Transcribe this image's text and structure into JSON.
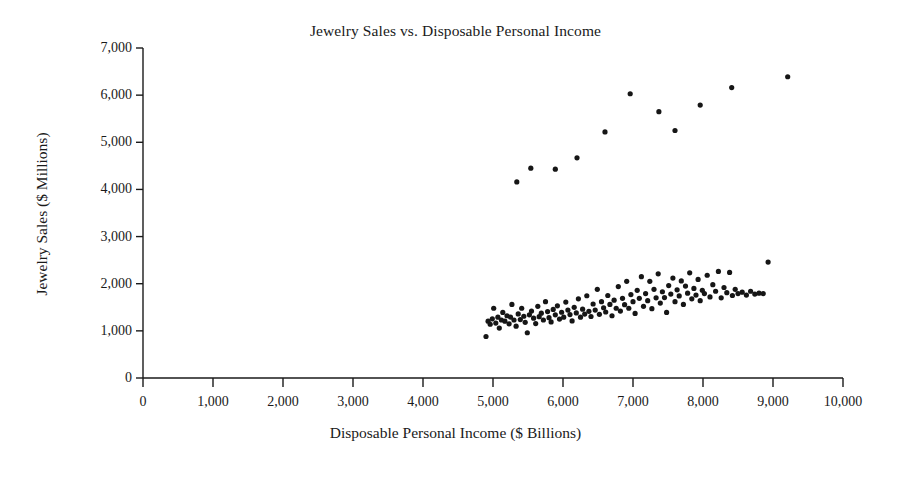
{
  "chart_data": {
    "type": "scatter",
    "title": "Jewelry Sales vs. Disposable Personal Income",
    "xlabel": "Disposable Personal Income ($ Billions)",
    "ylabel": "Jewelry Sales ($ Millions)",
    "xlim": [
      0,
      10000
    ],
    "ylim": [
      0,
      7000
    ],
    "xticks": [
      0,
      1000,
      2000,
      3000,
      4000,
      5000,
      6000,
      7000,
      8000,
      9000,
      10000
    ],
    "yticks": [
      0,
      1000,
      2000,
      3000,
      4000,
      5000,
      6000,
      7000
    ],
    "xtick_labels": [
      "0",
      "1,000",
      "2,000",
      "3,000",
      "4,000",
      "5,000",
      "6,000",
      "7,000",
      "8,000",
      "9,000",
      "10,000"
    ],
    "ytick_labels": [
      "0",
      "1,000",
      "2,000",
      "3,000",
      "4,000",
      "5,000",
      "6,000",
      "7,000"
    ],
    "grid": false,
    "legend": false,
    "marker": {
      "shape": "circle",
      "color": "#161616",
      "size": 5.2
    },
    "series": [
      {
        "name": "Monthly jewelry sales",
        "points": [
          [
            4900,
            880
          ],
          [
            4930,
            1205
          ],
          [
            4960,
            1140
          ],
          [
            4990,
            1255
          ],
          [
            5010,
            1480
          ],
          [
            5040,
            1165
          ],
          [
            5070,
            1290
          ],
          [
            5090,
            1060
          ],
          [
            5120,
            1230
          ],
          [
            5140,
            1390
          ],
          [
            5170,
            1205
          ],
          [
            5200,
            1320
          ],
          [
            5230,
            1150
          ],
          [
            5250,
            1290
          ],
          [
            5270,
            1560
          ],
          [
            5300,
            1230
          ],
          [
            5330,
            1100
          ],
          [
            5360,
            1360
          ],
          [
            5390,
            1240
          ],
          [
            5410,
            1480
          ],
          [
            5440,
            1310
          ],
          [
            5460,
            1180
          ],
          [
            5490,
            960
          ],
          [
            5520,
            1340
          ],
          [
            5550,
            1420
          ],
          [
            5580,
            1270
          ],
          [
            5610,
            1155
          ],
          [
            5640,
            1520
          ],
          [
            5660,
            1300
          ],
          [
            5690,
            1375
          ],
          [
            5720,
            1230
          ],
          [
            5750,
            1620
          ],
          [
            5780,
            1410
          ],
          [
            5800,
            1280
          ],
          [
            5830,
            1190
          ],
          [
            5860,
            1455
          ],
          [
            5890,
            1340
          ],
          [
            5920,
            1530
          ],
          [
            5950,
            1250
          ],
          [
            5980,
            1395
          ],
          [
            6010,
            1290
          ],
          [
            6040,
            1610
          ],
          [
            6070,
            1440
          ],
          [
            6100,
            1345
          ],
          [
            6130,
            1210
          ],
          [
            6160,
            1500
          ],
          [
            6190,
            1380
          ],
          [
            6220,
            1680
          ],
          [
            6250,
            1290
          ],
          [
            6280,
            1460
          ],
          [
            6310,
            1355
          ],
          [
            6340,
            1745
          ],
          [
            6370,
            1415
          ],
          [
            6400,
            1305
          ],
          [
            6430,
            1570
          ],
          [
            6460,
            1440
          ],
          [
            6490,
            1880
          ],
          [
            6520,
            1350
          ],
          [
            6550,
            1620
          ],
          [
            6580,
            1490
          ],
          [
            6610,
            1400
          ],
          [
            6640,
            1750
          ],
          [
            6670,
            1560
          ],
          [
            6700,
            1320
          ],
          [
            6730,
            1650
          ],
          [
            6760,
            1480
          ],
          [
            6790,
            1940
          ],
          [
            6820,
            1420
          ],
          [
            6850,
            1690
          ],
          [
            6880,
            1555
          ],
          [
            6910,
            2050
          ],
          [
            6940,
            1480
          ],
          [
            6970,
            1770
          ],
          [
            7000,
            1620
          ],
          [
            7030,
            1370
          ],
          [
            7060,
            1860
          ],
          [
            7090,
            1690
          ],
          [
            7120,
            2150
          ],
          [
            7150,
            1520
          ],
          [
            7180,
            1790
          ],
          [
            7210,
            1640
          ],
          [
            7240,
            2050
          ],
          [
            7270,
            1470
          ],
          [
            7300,
            1880
          ],
          [
            7330,
            1700
          ],
          [
            7360,
            2210
          ],
          [
            7390,
            1590
          ],
          [
            7420,
            1830
          ],
          [
            7450,
            1705
          ],
          [
            7480,
            1390
          ],
          [
            7510,
            1960
          ],
          [
            7540,
            1780
          ],
          [
            7570,
            2120
          ],
          [
            7600,
            1620
          ],
          [
            7630,
            1870
          ],
          [
            7660,
            1740
          ],
          [
            7690,
            2060
          ],
          [
            7720,
            1560
          ],
          [
            7750,
            1950
          ],
          [
            7780,
            1800
          ],
          [
            7810,
            2230
          ],
          [
            7840,
            1680
          ],
          [
            7870,
            1900
          ],
          [
            7900,
            1760
          ],
          [
            7930,
            2090
          ],
          [
            7960,
            1640
          ],
          [
            7990,
            1860
          ],
          [
            8020,
            1790
          ],
          [
            8060,
            2180
          ],
          [
            8100,
            1720
          ],
          [
            8140,
            1980
          ],
          [
            8180,
            1840
          ],
          [
            8220,
            2260
          ],
          [
            8260,
            1700
          ],
          [
            8300,
            1920
          ],
          [
            8340,
            1810
          ],
          [
            8380,
            2240
          ],
          [
            8420,
            1750
          ],
          [
            8460,
            1880
          ],
          [
            8500,
            1790
          ],
          [
            8560,
            1820
          ],
          [
            8620,
            1760
          ],
          [
            8680,
            1840
          ],
          [
            8740,
            1780
          ],
          [
            8800,
            1800
          ],
          [
            8860,
            1790
          ],
          [
            8930,
            2460
          ]
        ]
      },
      {
        "name": "December peak sales",
        "points": [
          [
            5340,
            4160
          ],
          [
            5540,
            4450
          ],
          [
            5890,
            4430
          ],
          [
            6200,
            4670
          ],
          [
            6600,
            5220
          ],
          [
            6960,
            6030
          ],
          [
            7370,
            5650
          ],
          [
            7600,
            5250
          ],
          [
            7960,
            5790
          ],
          [
            8410,
            6160
          ],
          [
            9210,
            6390
          ]
        ]
      }
    ]
  }
}
